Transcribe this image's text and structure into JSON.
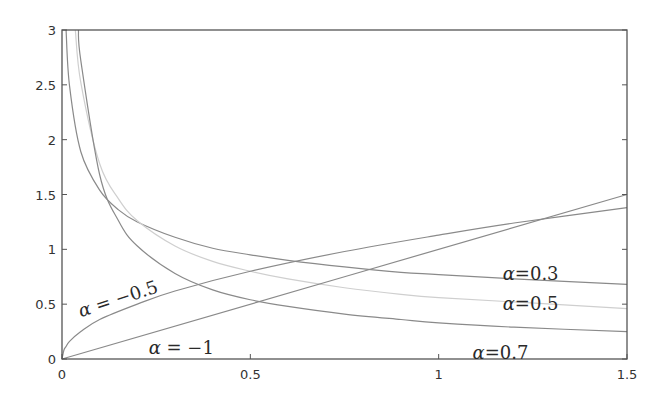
{
  "chart_data": {
    "type": "line",
    "title": "",
    "xlabel": "",
    "ylabel": "",
    "xlim": [
      0,
      1.5
    ],
    "ylim": [
      0,
      3
    ],
    "grid": false,
    "legend": "inline curve labels",
    "x_ticks": [
      "0",
      "0.5",
      "1",
      "1.5"
    ],
    "y_ticks": [
      "0",
      "0.5",
      "1",
      "1.5",
      "2",
      "2.5",
      "3"
    ],
    "series": [
      {
        "name": "α = 0.3",
        "color": "#8a8a8a",
        "x": [
          0.0108,
          0.02,
          0.05,
          0.1,
          0.15,
          0.2,
          0.3,
          0.4,
          0.5,
          0.6,
          0.75,
          0.9,
          1.0,
          1.2,
          1.5
        ],
        "y": [
          3.0,
          2.49,
          1.89,
          1.54,
          1.36,
          1.25,
          1.11,
          1.01,
          0.95,
          0.9,
          0.84,
          0.79,
          0.77,
          0.73,
          0.68
        ]
      },
      {
        "name": "α = 0.5",
        "color": "#cfcfcf",
        "x": [
          0.0354,
          0.05,
          0.1,
          0.15,
          0.2,
          0.3,
          0.4,
          0.5,
          0.6,
          0.75,
          0.9,
          1.0,
          1.2,
          1.5
        ],
        "y": [
          3.0,
          2.52,
          1.78,
          1.46,
          1.26,
          1.03,
          0.89,
          0.8,
          0.73,
          0.65,
          0.59,
          0.56,
          0.52,
          0.46
        ]
      },
      {
        "name": "α = 0.7",
        "color": "#8a8a8a",
        "x": [
          0.0436,
          0.05,
          0.1,
          0.15,
          0.2,
          0.3,
          0.4,
          0.5,
          0.6,
          0.75,
          0.9,
          1.0,
          1.2,
          1.5
        ],
        "y": [
          3.0,
          2.72,
          1.68,
          1.26,
          1.03,
          0.78,
          0.63,
          0.54,
          0.48,
          0.41,
          0.36,
          0.33,
          0.29,
          0.25
        ]
      },
      {
        "name": "α = −0.5",
        "color": "#8a8a8a",
        "x": [
          0,
          0.005,
          0.01,
          0.02,
          0.05,
          0.1,
          0.2,
          0.3,
          0.5,
          0.75,
          1.0,
          1.2,
          1.5
        ],
        "y": [
          0,
          0.08,
          0.11,
          0.16,
          0.25,
          0.36,
          0.5,
          0.62,
          0.8,
          0.98,
          1.13,
          1.24,
          1.38
        ]
      },
      {
        "name": "α = −1",
        "color": "#8a8a8a",
        "x": [
          0,
          1.5
        ],
        "y": [
          0,
          1.5
        ]
      }
    ],
    "annotations": [
      {
        "text_alpha": "α",
        "text_rest": " = −0.5",
        "x": 0.05,
        "y": 0.38,
        "rotate": -18
      },
      {
        "text_alpha": "α",
        "text_rest": " = −1",
        "x": 0.23,
        "y": 0.05,
        "rotate": 0
      },
      {
        "text_alpha": "α",
        "text_rest": "=0.3",
        "x": 1.17,
        "y": 0.72,
        "rotate": 0
      },
      {
        "text_alpha": "α",
        "text_rest": "=0.5",
        "x": 1.17,
        "y": 0.45,
        "rotate": 0
      },
      {
        "text_alpha": "α",
        "text_rest": "=0.7",
        "x": 1.09,
        "y": 0.0,
        "rotate": 0
      }
    ]
  },
  "plot_area": {
    "left": 62,
    "right": 627,
    "top": 30,
    "bottom": 359
  },
  "colors": {
    "axis": "#555555",
    "curve": "#8a8a8a",
    "curve_light": "#cfcfcf"
  }
}
